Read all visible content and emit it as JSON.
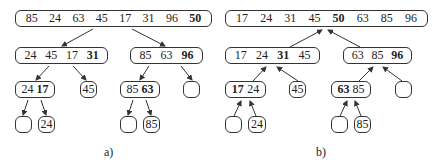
{
  "figure_a": {
    "label": "a)",
    "root": [
      "85",
      "24",
      "63",
      "45",
      "17",
      "31",
      "96",
      "50"
    ],
    "level1_left": [
      "24",
      "45",
      "17",
      "31"
    ],
    "level1_right": [
      "85",
      "63",
      "96"
    ],
    "level2": [
      [
        "24",
        "17"
      ],
      [
        "45"
      ],
      [
        "85",
        "63"
      ],
      []
    ],
    "level3": [
      [],
      [
        "24"
      ],
      [],
      [
        "85"
      ]
    ]
  },
  "figure_b": {
    "label": "b)",
    "root": [
      "17",
      "24",
      "31",
      "45",
      "50",
      "63",
      "85",
      "96"
    ],
    "level1_left": [
      "17",
      "24",
      "31",
      "45"
    ],
    "level1_right": [
      "63",
      "85",
      "96"
    ],
    "level2": [
      [
        "17",
        "24"
      ],
      [
        "45"
      ],
      [
        "63",
        "85"
      ],
      []
    ],
    "level3": [
      [],
      [
        "24"
      ],
      [],
      [
        "85"
      ]
    ]
  }
}
